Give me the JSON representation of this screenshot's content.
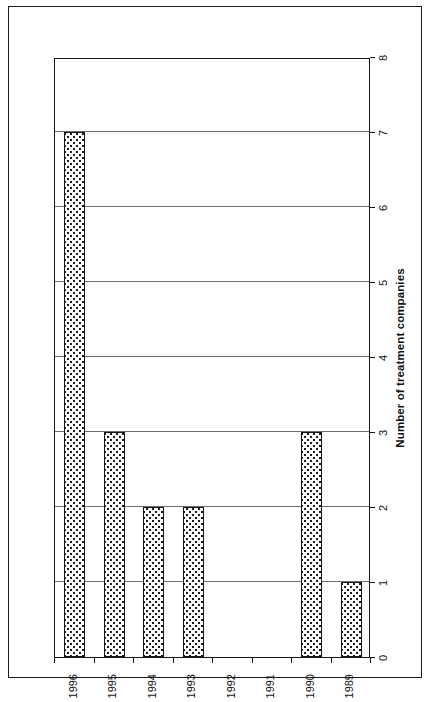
{
  "figure": {
    "orientation": "rotated-90",
    "frame_visible": true
  },
  "chart_data": {
    "type": "bar",
    "title": "",
    "subtitle": "",
    "orientation": "horizontal",
    "categories": [
      "1989",
      "1990",
      "1991",
      "1992",
      "1993",
      "1994",
      "1995",
      "1996"
    ],
    "values": [
      1,
      3,
      0,
      0,
      2,
      2,
      3,
      7
    ],
    "xlabel": "",
    "ylabel": "Number of treatment companies",
    "value_ticks": [
      "0",
      "1",
      "2",
      "3",
      "4",
      "5",
      "6",
      "7",
      "8"
    ],
    "ylim": [
      0,
      8
    ],
    "grid": true,
    "grid_axis": "value",
    "legend": null,
    "legend_position": "none",
    "bar_fill": "#ffffff",
    "bar_pattern": "dotted-stipple",
    "bar_edge_color": "#161616",
    "axis_color": "#161616",
    "gridline_color": "#6e6e6e",
    "background": "#ffffff"
  },
  "axes": {
    "value_axis_title": "Number of treatment companies",
    "value_axis_labels": [
      "0",
      "1",
      "2",
      "3",
      "4",
      "5",
      "6",
      "7",
      "8"
    ],
    "category_axis_labels": [
      "1989",
      "1990",
      "1991",
      "1992",
      "1993",
      "1994",
      "1995",
      "1996"
    ]
  }
}
